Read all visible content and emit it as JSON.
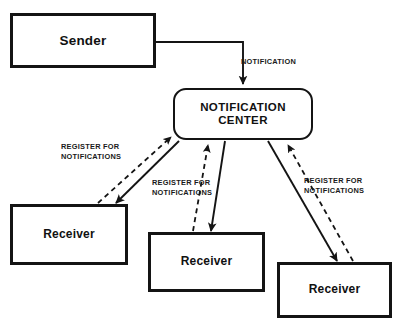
{
  "diagram": {
    "background_color": "#ffffff",
    "stroke_color": "#141414",
    "nodes": {
      "sender": {
        "label": "Sender",
        "shape": "rectangle",
        "x": 10,
        "y": 13,
        "width": 146,
        "height": 55
      },
      "notification_center": {
        "label": "NOTIFICATION\nCENTER",
        "line1": "NOTIFICATION",
        "line2": "CENTER",
        "shape": "rounded-rectangle",
        "x": 173,
        "y": 88,
        "width": 140,
        "height": 52
      },
      "receiver_1": {
        "label": "Receiver",
        "shape": "rectangle",
        "x": 10,
        "y": 204,
        "width": 118,
        "height": 61
      },
      "receiver_2": {
        "label": "Receiver",
        "shape": "rectangle",
        "x": 148,
        "y": 232,
        "width": 117,
        "height": 60
      },
      "receiver_3": {
        "label": "Receiver",
        "shape": "rectangle",
        "x": 277,
        "y": 262,
        "width": 115,
        "height": 56
      }
    },
    "edge_labels": {
      "notification": "NOTIFICATION",
      "register_left_line1": "REGISTER FOR",
      "register_left_line2": "NOTIFICATIONS",
      "register_middle_line1": "REGISTER FOR",
      "register_middle_line2": "NOTIFICATIONS",
      "register_right_line1": "REGISTER FOR",
      "register_right_line2": "NOTIFICATIONS"
    },
    "edges": [
      {
        "name": "sender-to-center",
        "from": "sender",
        "to": "notification_center",
        "style": "solid",
        "routing": "elbow",
        "label": "NOTIFICATION",
        "arrowhead": "end"
      },
      {
        "name": "center-to-receiver-1",
        "from": "notification_center",
        "to": "receiver_1",
        "style": "solid",
        "arrowhead": "end"
      },
      {
        "name": "receiver-1-to-center",
        "from": "receiver_1",
        "to": "notification_center",
        "style": "dashed",
        "label": "REGISTER FOR NOTIFICATIONS",
        "arrowhead": "end"
      },
      {
        "name": "center-to-receiver-2",
        "from": "notification_center",
        "to": "receiver_2",
        "style": "solid",
        "arrowhead": "end"
      },
      {
        "name": "receiver-2-to-center",
        "from": "receiver_2",
        "to": "notification_center",
        "style": "dashed",
        "label": "REGISTER FOR NOTIFICATIONS",
        "arrowhead": "end"
      },
      {
        "name": "center-to-receiver-3",
        "from": "notification_center",
        "to": "receiver_3",
        "style": "solid",
        "arrowhead": "end"
      },
      {
        "name": "receiver-3-to-center",
        "from": "receiver_3",
        "to": "notification_center",
        "style": "dashed",
        "label": "REGISTER FOR NOTIFICATIONS",
        "arrowhead": "end"
      }
    ]
  }
}
